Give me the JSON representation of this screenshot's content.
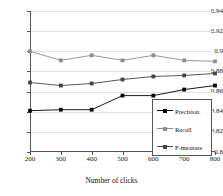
{
  "chart_data": {
    "type": "line",
    "title": "",
    "xlabel": "Number of clicks",
    "ylabel": "",
    "x": [
      200,
      300,
      400,
      500,
      600,
      700,
      800
    ],
    "xtick_labels": [
      "200",
      "300",
      "400",
      "500",
      "600",
      "700",
      "800"
    ],
    "ytick_labels": [
      "0.8",
      "0.82",
      "0.84",
      "0.86",
      "0.88",
      "0.9",
      "0.92",
      "0.94"
    ],
    "ytick_values": [
      0.8,
      0.82,
      0.84,
      0.86,
      0.88,
      0.9,
      0.92,
      0.94
    ],
    "ylim": [
      0.8,
      0.94
    ],
    "xlim": [
      200,
      800
    ],
    "grid": true,
    "legend_position": "lower right",
    "series": [
      {
        "name": "Precision",
        "color": "#000000",
        "values": [
          0.841,
          0.842,
          0.842,
          0.856,
          0.856,
          0.862,
          0.866
        ]
      },
      {
        "name": "Recall",
        "color": "#8c8c8c",
        "values": [
          0.9,
          0.891,
          0.896,
          0.891,
          0.896,
          0.891,
          0.89
        ]
      },
      {
        "name": "F-measure",
        "color": "#444444",
        "values": [
          0.869,
          0.866,
          0.868,
          0.872,
          0.875,
          0.876,
          0.878
        ]
      }
    ]
  },
  "legend": {
    "entries": [
      "Precision",
      "Recall",
      "F-measure"
    ]
  },
  "axes": {
    "x_title": "Number of clicks"
  }
}
